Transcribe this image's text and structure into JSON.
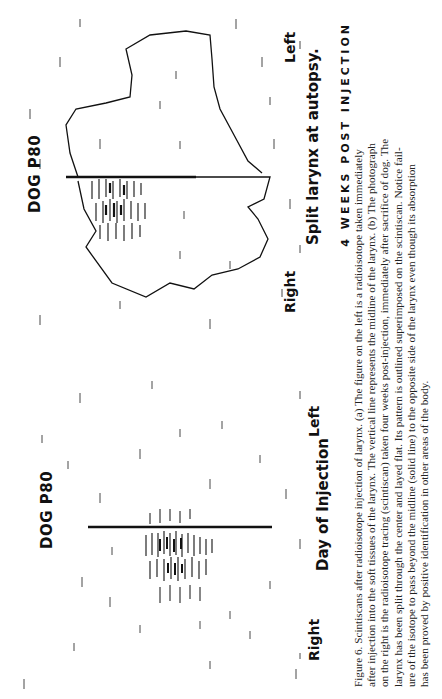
{
  "figure": {
    "panel_a": {
      "dog_label": "DOG P80",
      "side_left": "Left",
      "side_right": "Right",
      "title": "Day of Injection"
    },
    "panel_b": {
      "dog_label": "DOG P80",
      "side_left": "Left",
      "side_right": "Right",
      "title": "Split larynx at autopsy."
    },
    "overall_title": "4 WEEKS POST INJECTION"
  },
  "caption": {
    "lines": [
      "Figure 6. Scintiscans after radioisotope injection of larynx. (a) The figure on the left is a radioisotope taken immediately",
      "after injection into the soft tissues of the larynx. The vertical line represents the midline of the larynx. (b) The photograph",
      "on the right is the radioisotope tracing (scintiscan) taken four weeks post-injection, immediately after sacrifice of dog. The",
      "larynx has been split through the center and layed flat. Its pattern is outlined superimposed on the scintiscan. Notice fail-",
      "ure of the isotope to pass beyond the midline (solid line) to the opposite side of the larynx even though its absorption",
      "has been proved by positive identification in other areas of the body."
    ]
  },
  "colors": {
    "ink": "#111111",
    "paper": "#ffffff",
    "caption_text": "#222222"
  }
}
